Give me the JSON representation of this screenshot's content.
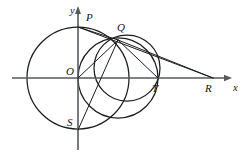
{
  "figure": {
    "kind": "geometry-diagram",
    "width": 251,
    "height": 153,
    "background_color": "#ffffff",
    "stroke_color": "#1d1d1f",
    "axis_color": "#555a5e",
    "label_color": "#131316"
  },
  "axes": {
    "x_label": "x",
    "y_label": "y",
    "origin_label": "O",
    "x_axis_y": 78,
    "y_axis_x": 78,
    "x_axis_from": 12,
    "x_axis_to": 228,
    "y_axis_from": 10,
    "y_axis_to": 150
  },
  "points": [
    {
      "id": "P",
      "label": "P",
      "x": 78,
      "y": 27,
      "label_x": 86,
      "label_y": 12
    },
    {
      "id": "Q",
      "label": "Q",
      "x": 118,
      "y": 40,
      "label_x": 117,
      "label_y": 22
    },
    {
      "id": "O",
      "label": "O",
      "x": 78,
      "y": 78,
      "label_x": 66,
      "label_y": 66
    },
    {
      "id": "T",
      "label": "T",
      "x": 158,
      "y": 78,
      "label_x": 152,
      "label_y": 83
    },
    {
      "id": "R",
      "label": "R",
      "x": 213,
      "y": 78,
      "label_x": 205,
      "label_y": 83
    },
    {
      "id": "S",
      "label": "S",
      "x": 78,
      "y": 130,
      "label_x": 67,
      "label_y": 117
    }
  ],
  "axis_labels": [
    {
      "id": "x-axis-label",
      "label": "x",
      "label_x": 233,
      "label_y": 83
    },
    {
      "id": "y-axis-label",
      "label": "y",
      "label_x": 70,
      "label_y": 6
    }
  ],
  "circles": [
    {
      "id": "big-circle",
      "cx": 78,
      "cy": 78,
      "r": 51
    },
    {
      "id": "middle-circle",
      "cx": 118,
      "cy": 78,
      "r": 40
    },
    {
      "id": "right-circle",
      "cx": 127,
      "cy": 68,
      "r": 33
    }
  ],
  "segments": [
    {
      "id": "QP",
      "from": "Q",
      "to": "P",
      "x1": 118,
      "y1": 40,
      "x2": 78,
      "y2": 27
    },
    {
      "id": "QO",
      "from": "Q",
      "to": "O",
      "x1": 118,
      "y1": 40,
      "x2": 78,
      "y2": 78
    },
    {
      "id": "QS",
      "from": "Q",
      "to": "S",
      "x1": 118,
      "y1": 40,
      "x2": 78,
      "y2": 130
    },
    {
      "id": "QT",
      "from": "Q",
      "to": "T",
      "x1": 118,
      "y1": 40,
      "x2": 158,
      "y2": 78
    },
    {
      "id": "QR",
      "from": "Q",
      "to": "R",
      "x1": 118,
      "y1": 40,
      "x2": 213,
      "y2": 78
    },
    {
      "id": "PR",
      "from": "P",
      "to": "R",
      "x1": 78,
      "y1": 27,
      "x2": 213,
      "y2": 78
    }
  ]
}
